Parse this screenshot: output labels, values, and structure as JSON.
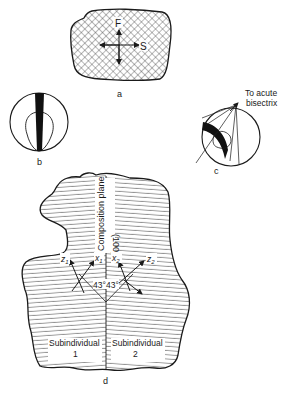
{
  "panels": {
    "a": {
      "label": "a",
      "axis_vertical": "F",
      "axis_horizontal": "S"
    },
    "b": {
      "label": "b"
    },
    "c": {
      "label": "c",
      "annotation_line1": "To acute",
      "annotation_line2": "bisectrix"
    },
    "d": {
      "label": "d",
      "composition_plane": "Composition plane",
      "plane_index": "(100)",
      "z1": "z",
      "z1_sub": "1",
      "x1": "x",
      "x1_sub": "1",
      "x2": "x",
      "x2_sub": "2",
      "z2": "z",
      "z2_sub": "2",
      "angle_left": "43°",
      "angle_right": "43°",
      "sub1_line1": "Subindividual",
      "sub1_line2": "1",
      "sub2_line1": "Subindividual",
      "sub2_line2": "2"
    }
  },
  "colors": {
    "ink": "#1a1a1a",
    "background": "#ffffff"
  }
}
